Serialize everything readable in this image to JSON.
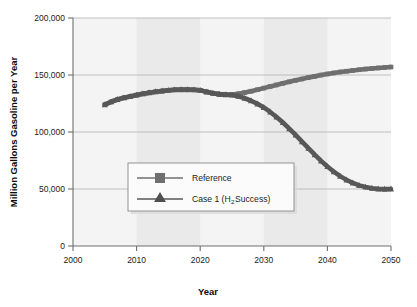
{
  "chart_data": {
    "type": "line",
    "title": "",
    "xlabel": "Year",
    "ylabel": "Million Gallons Gasoline per Year",
    "xlim": [
      2000,
      2050
    ],
    "ylim": [
      0,
      200000
    ],
    "xticks": [
      "2000",
      "2010",
      "2020",
      "2030",
      "2040",
      "2050"
    ],
    "yticks": [
      "0",
      "50,000",
      "100,000",
      "150,000",
      "200,000"
    ],
    "grid": "horizontal",
    "legend_position": "inside-lower-left",
    "banding": "alternating vertical decade bands (2010-2020, 2030-2040 shaded)",
    "x": [
      2005,
      2006,
      2007,
      2008,
      2009,
      2010,
      2011,
      2012,
      2013,
      2014,
      2015,
      2016,
      2017,
      2018,
      2019,
      2020,
      2021,
      2022,
      2023,
      2024,
      2025,
      2026,
      2027,
      2028,
      2029,
      2030,
      2031,
      2032,
      2033,
      2034,
      2035,
      2036,
      2037,
      2038,
      2039,
      2040,
      2041,
      2042,
      2043,
      2044,
      2045,
      2046,
      2047,
      2048,
      2049,
      2050
    ],
    "series": [
      {
        "name": "Reference",
        "marker": "square",
        "color": "#6f6f6f",
        "values": [
          124000,
          126500,
          128500,
          130000,
          131200,
          132400,
          133500,
          134500,
          135300,
          136000,
          136600,
          137000,
          137200,
          137200,
          137000,
          136600,
          135200,
          134000,
          133200,
          132800,
          132900,
          133600,
          134600,
          135800,
          137100,
          138500,
          139900,
          141300,
          142700,
          144000,
          145300,
          146500,
          147700,
          148800,
          149900,
          150900,
          151800,
          152600,
          153300,
          154000,
          154600,
          155200,
          155700,
          156200,
          156600,
          157000
        ]
      },
      {
        "name": "Case 1 (H2 Success)",
        "marker": "triangle",
        "color": "#585858",
        "values": [
          124000,
          126500,
          128500,
          130000,
          131200,
          132400,
          133500,
          134500,
          135300,
          136000,
          136600,
          137000,
          137200,
          137200,
          137000,
          136600,
          135200,
          134000,
          133200,
          132800,
          132400,
          131300,
          129600,
          127400,
          124700,
          121500,
          117600,
          113200,
          108300,
          103000,
          97400,
          91600,
          85800,
          80100,
          74700,
          69700,
          65200,
          61300,
          58000,
          55300,
          53200,
          51700,
          50700,
          50100,
          49900,
          50000
        ]
      }
    ],
    "legend": [
      {
        "label_main": "Reference",
        "label_sub": "",
        "label_tail": ""
      },
      {
        "label_main": "Case 1 (H",
        "label_sub": "2",
        "label_tail": " Success)"
      }
    ]
  },
  "colors": {
    "plot_background": "#f4f4f4",
    "band_shade": "#eaeaea",
    "axis": "#6e6e6e",
    "gridline": "#b9b9b9",
    "reference_series": "#6f6f6f",
    "case1_series": "#585858",
    "legend_background": "#fbfbfb",
    "legend_border": "#8a8a8a",
    "text": "#1b1b1b"
  }
}
